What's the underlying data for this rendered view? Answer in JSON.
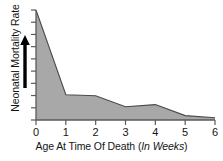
{
  "chart_data": {
    "type": "area",
    "title": "",
    "xlabel": "Age At Time Of Death (In Weeks)",
    "xlabel_main": "Age At Time Of Death (",
    "xlabel_unit": "In Weeks",
    "xlabel_close": ")",
    "ylabel": "Neonatal Mortality Rate",
    "x": [
      0,
      1,
      2,
      3,
      4,
      5,
      6
    ],
    "values": [
      100,
      23,
      22,
      12,
      14,
      4,
      2
    ],
    "xlim": [
      0,
      6
    ],
    "ylim": [
      0,
      100
    ],
    "xticks": [
      "0",
      "1",
      "2",
      "3",
      "4",
      "5",
      "6"
    ],
    "xtick_values": [
      0,
      1,
      2,
      3,
      4,
      5,
      6
    ],
    "yticks": [],
    "ytick_count": 9,
    "ytick_labels_shown": false,
    "grid": false,
    "legend": null,
    "fill_color": "#a8a8a8",
    "line_color": "#4a4a4a",
    "axis_color": "#5a5a5a",
    "text_color": "#141414",
    "y_direction_arrow": "up-arrow-icon",
    "y_direction_note": "increasing"
  }
}
